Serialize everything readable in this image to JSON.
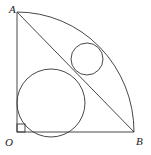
{
  "figure": {
    "labels": {
      "A": "A",
      "B": "B",
      "O": "O"
    },
    "points": {
      "O": [
        17,
        132
      ],
      "A": [
        17,
        12
      ],
      "B": [
        134,
        132
      ]
    },
    "right_angle_marker": {
      "at": "O",
      "size": 8
    },
    "circles": [
      {
        "name": "large-inscribed-circle",
        "cx": 51,
        "cy": 103,
        "r": 34
      },
      {
        "name": "small-inscribed-circle",
        "cx": 87,
        "cy": 59,
        "r": 16
      }
    ],
    "stroke_color": "#333333"
  }
}
